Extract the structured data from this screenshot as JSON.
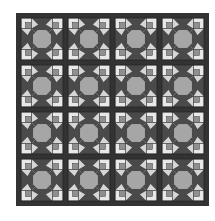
{
  "image": {
    "subject": "quilt pattern",
    "description": "4x4 grid of star quilt blocks with dark sashing",
    "caption": ""
  },
  "quilt": {
    "rows": 4,
    "cols": 4,
    "colors": {
      "background": "#ffffff",
      "sashing": "#333333",
      "dark": "#4a4a4a",
      "medium": "#8f8f8f",
      "center": "#a6a6a6",
      "light": "#d6d6d6",
      "lighter": "#e8e8e8",
      "line": "#2a2a2a"
    }
  }
}
